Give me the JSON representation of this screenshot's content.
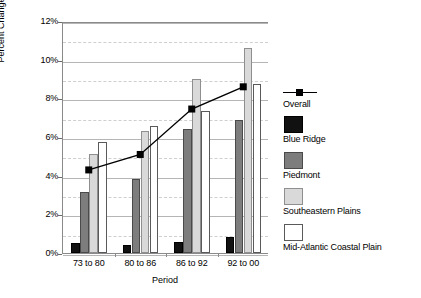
{
  "chart_data": {
    "type": "bar",
    "title": "",
    "xlabel": "Period",
    "ylabel": "Percent Change",
    "categories": [
      "73 to 80",
      "80 to 86",
      "86 to 92",
      "92 to 00"
    ],
    "ylim": [
      0,
      12
    ],
    "y_ticks": [
      "0%",
      "2%",
      "4%",
      "6%",
      "8%",
      "10%",
      "12%"
    ],
    "y_tick_values": [
      0,
      2,
      4,
      6,
      8,
      10,
      12
    ],
    "y_tick_suffix": "%",
    "grid": true,
    "grid_minor": true,
    "legend_position": "right",
    "series": [
      {
        "name": "Overall",
        "type": "line",
        "marker": "square",
        "color": "#000000",
        "values": [
          4.4,
          5.2,
          7.55,
          8.7
        ]
      },
      {
        "name": "Blue Ridge",
        "type": "bar",
        "color": "#111111",
        "values": [
          0.5,
          0.4,
          0.55,
          0.85
        ]
      },
      {
        "name": "Piedmont",
        "type": "bar",
        "color": "#7d7d7d",
        "values": [
          3.15,
          3.85,
          6.4,
          6.9
        ]
      },
      {
        "name": "Southeastern Plains",
        "type": "bar",
        "color": "#d9d9d9",
        "values": [
          5.1,
          6.3,
          9.0,
          10.6
        ]
      },
      {
        "name": "Mid-Atlantic Coastal Plain",
        "type": "bar",
        "color": "#ffffff",
        "values": [
          5.75,
          6.55,
          7.35,
          8.75
        ]
      }
    ]
  }
}
